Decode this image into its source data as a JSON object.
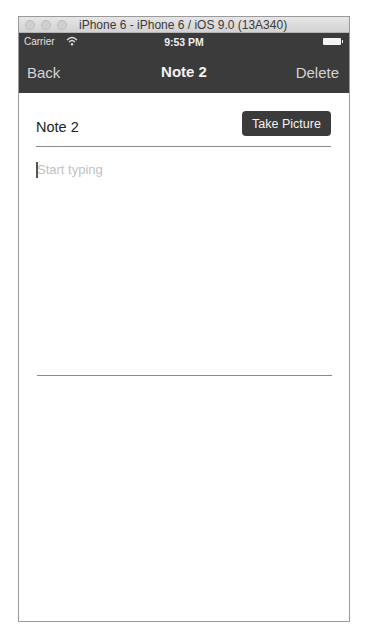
{
  "window": {
    "title": "iPhone 6 - iPhone 6 / iOS 9.0 (13A340)"
  },
  "status_bar": {
    "carrier": "Carrier",
    "wifi_icon": "wifi-icon",
    "time": "9:53 PM",
    "battery_icon": "battery-icon"
  },
  "nav_bar": {
    "back_label": "Back",
    "title": "Note 2",
    "delete_label": "Delete",
    "background_color": "#3b3b3b"
  },
  "note": {
    "title_value": "Note 2",
    "take_picture_label": "Take Picture",
    "body_value": "",
    "body_placeholder": "Start typing"
  }
}
